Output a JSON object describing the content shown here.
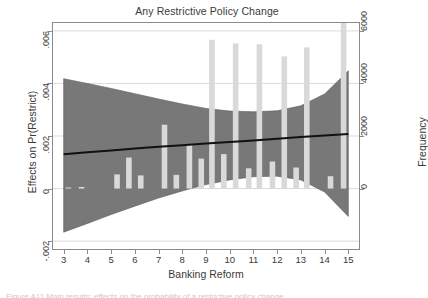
{
  "chart_data": {
    "type": "bar",
    "title": "Any Restrictive Policy Change",
    "xlabel": "Banking Reform",
    "ylabel": "Effects on Pr(Restrict)",
    "ylabel_right": "Frequency",
    "xlim": [
      2.55,
      15.45
    ],
    "ylim": [
      -0.0023,
      0.0063
    ],
    "ylim_right": [
      -2300,
      6300
    ],
    "grid": true,
    "legend": "none",
    "xticks": [
      3,
      4,
      5,
      6,
      7,
      8,
      9,
      10,
      11,
      12,
      13,
      14,
      15
    ],
    "xticklabels": [
      "3",
      "4",
      "5",
      "6",
      "7",
      "8",
      "9",
      "10",
      "11",
      "12",
      "13",
      "14",
      "15"
    ],
    "yticks_left": [
      -0.002,
      0,
      0.002,
      0.004,
      0.006
    ],
    "yticklabels_left": [
      "-.002",
      "0",
      ".002",
      ".004",
      ".006"
    ],
    "yticks_right": [
      0,
      2000,
      4000,
      6000,
      8000
    ],
    "yticklabels_right": [
      "0",
      "2000",
      "4000",
      "6000",
      "8000"
    ],
    "series": [
      {
        "name": "Frequency",
        "type": "bar",
        "axis": "right",
        "color": "#d9d9d9",
        "categories": [
          3.2,
          3.75,
          5.25,
          5.75,
          6.25,
          7.25,
          7.75,
          8.3,
          8.8,
          9.25,
          9.75,
          10.25,
          10.8,
          11.25,
          11.8,
          12.3,
          12.8,
          13.25,
          14.25,
          14.8
        ],
        "values": [
          40,
          60,
          540,
          1180,
          500,
          2430,
          520,
          1680,
          1140,
          5660,
          1310,
          5520,
          770,
          5490,
          1030,
          5030,
          800,
          5370,
          470,
          6430
        ]
      },
      {
        "name": "Marginal effect",
        "type": "line",
        "axis": "left",
        "color": "#111111",
        "x": [
          3,
          4,
          5,
          6,
          7,
          8,
          9,
          10,
          11,
          12,
          13,
          14,
          15
        ],
        "values": [
          0.00131,
          0.00138,
          0.00145,
          0.00152,
          0.00159,
          0.00165,
          0.00171,
          0.00177,
          0.00183,
          0.0019,
          0.00196,
          0.00202,
          0.00208
        ]
      },
      {
        "name": "95% confidence interval",
        "type": "band",
        "axis": "left",
        "color": "#787878",
        "x": [
          3,
          4,
          5,
          6,
          7,
          8,
          9,
          10,
          11,
          12,
          13,
          14,
          15
        ],
        "upper": [
          0.00418,
          0.004,
          0.00381,
          0.00361,
          0.00341,
          0.00322,
          0.00305,
          0.00295,
          0.00292,
          0.00296,
          0.00315,
          0.0036,
          0.00448
        ],
        "lower": [
          -0.00166,
          -0.00133,
          -0.00099,
          -0.00067,
          -0.00036,
          -9e-05,
          0.00015,
          0.00033,
          0.00045,
          0.00047,
          0.00033,
          -0.00013,
          -0.00106
        ]
      }
    ]
  },
  "caption": "Figure A11  Main results: effects on the probability of a restrictive policy change"
}
